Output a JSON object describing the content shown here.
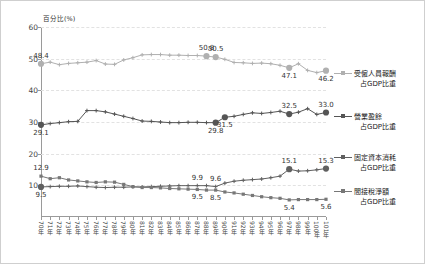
{
  "chart_data": {
    "type": "line",
    "title": "",
    "ylabel": "百分比(%)",
    "xlabel": "",
    "ylim": [
      0,
      60
    ],
    "yticks": [
      10,
      20,
      30,
      40,
      50,
      60
    ],
    "grid": true,
    "legend_position": "right",
    "categories": [
      "70年",
      "71年",
      "72年",
      "73年",
      "74年",
      "75年",
      "76年",
      "77年",
      "78年",
      "79年",
      "80年",
      "81年",
      "82年",
      "83年",
      "84年",
      "85年",
      "86年",
      "87年",
      "88年",
      "89年",
      "90年",
      "91年",
      "92年",
      "93年",
      "94年",
      "95年",
      "96年",
      "97年",
      "98年",
      "99年",
      "100年",
      "101年"
    ],
    "series": [
      {
        "name": "受僱人員報酬占GDP比重",
        "color": "#b0b0b0",
        "marker": "cross",
        "values": [
          48.4,
          48.9,
          48.1,
          48.5,
          48.7,
          48.9,
          49.4,
          48.3,
          48.2,
          49.6,
          50.3,
          51.2,
          51.3,
          51.3,
          51.1,
          51.1,
          51.0,
          51.0,
          50.8,
          50.5,
          49.8,
          48.8,
          48.7,
          48.5,
          48.6,
          48.4,
          47.9,
          47.1,
          48.4,
          46.3,
          45.6,
          46.2
        ],
        "labeled": [
          {
            "index": 0,
            "value": "48.4",
            "pos": "above"
          },
          {
            "index": 18,
            "value": "50.8",
            "pos": "above"
          },
          {
            "index": 19,
            "value": "50.5",
            "pos": "above"
          },
          {
            "index": 27,
            "value": "47.1",
            "pos": "below"
          },
          {
            "index": 31,
            "value": "46.2",
            "pos": "below"
          }
        ],
        "highlight": [
          0,
          18,
          19,
          27,
          31
        ]
      },
      {
        "name": "營業盈餘占GDP比重",
        "color": "#555555",
        "marker": "cross",
        "values": [
          29.1,
          29.5,
          29.8,
          30.1,
          30.2,
          33.6,
          33.6,
          33.2,
          32.5,
          31.8,
          31.1,
          30.3,
          30.2,
          30.0,
          29.8,
          29.8,
          29.9,
          29.9,
          29.8,
          29.8,
          31.5,
          31.8,
          32.4,
          32.9,
          32.7,
          33.0,
          33.4,
          32.5,
          33.1,
          34.2,
          32.4,
          33.0
        ],
        "labeled": [
          {
            "index": 0,
            "value": "29.1",
            "pos": "below"
          },
          {
            "index": 19,
            "value": "29.8",
            "pos": "below"
          },
          {
            "index": 20,
            "value": "31.5",
            "pos": "below"
          },
          {
            "index": 27,
            "value": "32.5",
            "pos": "above"
          },
          {
            "index": 31,
            "value": "33.0",
            "pos": "above"
          }
        ],
        "highlight": [
          0,
          19,
          20,
          27,
          31
        ]
      },
      {
        "name": "固定資本消耗占GDP比重",
        "color": "#606060",
        "marker": "cross",
        "values": [
          9.5,
          9.6,
          9.7,
          9.7,
          9.8,
          9.6,
          9.4,
          9.3,
          9.4,
          9.4,
          9.5,
          9.5,
          9.6,
          9.7,
          9.8,
          9.9,
          9.9,
          9.9,
          9.9,
          9.6,
          10.7,
          11.3,
          11.6,
          11.8,
          12.0,
          12.4,
          12.9,
          15.1,
          14.5,
          14.6,
          14.9,
          15.3
        ],
        "labeled": [
          {
            "index": 0,
            "value": "9.5",
            "pos": "below"
          },
          {
            "index": 17,
            "value": "9.9",
            "pos": "above"
          },
          {
            "index": 19,
            "value": "9.6",
            "pos": "above"
          },
          {
            "index": 27,
            "value": "15.1",
            "pos": "above"
          },
          {
            "index": 31,
            "value": "15.3",
            "pos": "above"
          }
        ],
        "highlight": [
          0,
          27,
          31
        ]
      },
      {
        "name": "間接稅淨額占GDP比重",
        "color": "#777777",
        "marker": "square",
        "values": [
          12.9,
          12.1,
          12.4,
          11.7,
          11.4,
          11.1,
          10.9,
          11.1,
          11.0,
          10.3,
          9.6,
          9.3,
          9.3,
          9.2,
          9.0,
          8.9,
          8.8,
          8.7,
          8.5,
          8.5,
          7.9,
          7.6,
          7.2,
          6.8,
          6.4,
          6.1,
          5.9,
          5.4,
          5.5,
          5.5,
          5.5,
          5.6
        ],
        "labeled": [
          {
            "index": 0,
            "value": "12.9",
            "pos": "above"
          },
          {
            "index": 17,
            "value": "9.5",
            "pos": "below"
          },
          {
            "index": 19,
            "value": "8.5",
            "pos": "below"
          },
          {
            "index": 27,
            "value": "5.4",
            "pos": "below"
          },
          {
            "index": 31,
            "value": "5.6",
            "pos": "below"
          }
        ],
        "highlight": []
      }
    ]
  },
  "legend": {
    "entries": [
      {
        "line1": "受僱人員報酬",
        "line2": "占GDP比重",
        "color": "#b0b0b0"
      },
      {
        "line1": "營業盈餘",
        "line2": "占GDP比重",
        "color": "#555555"
      },
      {
        "line1": "固定資本消耗",
        "line2": "占GDP比重",
        "color": "#606060"
      },
      {
        "line1": "間接稅淨額",
        "line2": "占GDP比重",
        "color": "#777777"
      }
    ]
  }
}
